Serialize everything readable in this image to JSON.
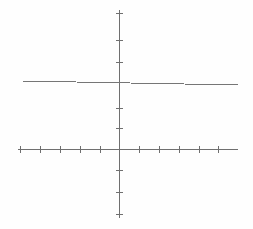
{
  "figure": {
    "title": "",
    "background_color": "#fefefe",
    "width": 253,
    "height": 229
  },
  "chart_data": {
    "type": "line",
    "title": "",
    "subtitle": "",
    "xlabel": "",
    "ylabel": "",
    "grid": false,
    "legend": null,
    "xlim": [
      -6,
      6
    ],
    "ylim": [
      -5,
      5
    ],
    "axis_color": "#6f6f6f",
    "axis_line_width": 1,
    "tick_color": "#6f6f6f",
    "tick_length": 7,
    "x_axis": {
      "name": "x-axis",
      "pixel_y": 149,
      "pixel_x_start": 18,
      "pixel_x_end": 238,
      "ticks": [
        -5,
        -4,
        -3,
        -2,
        -1,
        1,
        2,
        3,
        4,
        5
      ],
      "tick_pixel_x": [
        20,
        40,
        60,
        80,
        100,
        139,
        159,
        179,
        199,
        218
      ],
      "tick_labels": []
    },
    "y_axis": {
      "name": "y-axis",
      "pixel_x": 119,
      "pixel_y_start": 10,
      "pixel_y_end": 218,
      "ticks": [
        4,
        3,
        2,
        1,
        -1,
        -2,
        -3,
        -4
      ],
      "tick_pixel_y": [
        13,
        40,
        62,
        108,
        128,
        170,
        192,
        214
      ],
      "tick_labels": []
    },
    "series": [
      {
        "name": "constant-line",
        "type": "line",
        "color": "#767676",
        "line_width": 1,
        "points": [
          {
            "x": -5.0,
            "y": 2.2,
            "pixel_x": 22,
            "pixel_y": 81
          },
          {
            "x": 5.5,
            "y": 2.0,
            "pixel_x": 238,
            "pixel_y": 85
          }
        ]
      }
    ]
  }
}
